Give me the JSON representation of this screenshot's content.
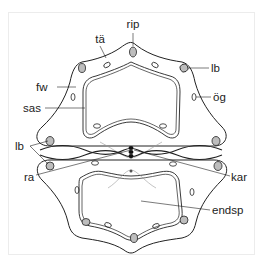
{
  "diagram": {
    "type": "anatomical cross-section (two adjacent segments)",
    "labels": {
      "rip": "rip",
      "ta": "tä",
      "lb_top": "lb",
      "fw": "fw",
      "og": "ög",
      "sas": "sas",
      "lb_left": "lb",
      "ra": "ra",
      "kar": "kar",
      "endsp": "endsp"
    },
    "colors": {
      "line": "#222222",
      "faint_line": "#9a9a9a",
      "bundle_fill": "#bdbdbd",
      "background": "#ffffff",
      "frame": "#ececec"
    }
  }
}
